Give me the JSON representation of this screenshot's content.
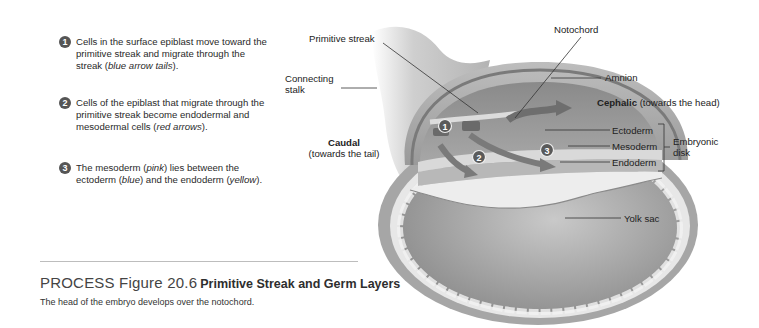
{
  "steps": [
    {
      "number": "1",
      "text_before": "Cells in the surface epiblast move toward the primitive streak and migrate through the streak (",
      "italic": "blue arrow tails",
      "text_after": ")."
    },
    {
      "number": "2",
      "text_before": "Cells of the epiblast that migrate through the primitive streak become endodermal and mesodermal cells (",
      "italic": "red arrows",
      "text_after": ")."
    },
    {
      "number": "3",
      "text_before": "The mesoderm (",
      "italic": "pink",
      "text_mid1": ") lies between the ectoderm (",
      "italic2": "blue",
      "text_mid2": ") and the endoderm (",
      "italic3": "yellow",
      "text_after": ")."
    }
  ],
  "caption": {
    "lead": "PROCESS Figure 20.6",
    "title": "Primitive Streak and Germ Layers",
    "subtitle": "The head of the embryo develops over the notochord."
  },
  "labels": {
    "primitive_streak": "Primitive streak",
    "notochord": "Notochord",
    "connecting_stalk_1": "Connecting",
    "connecting_stalk_2": "stalk",
    "amnion": "Amnion",
    "cephalic_bold": "Cephalic",
    "cephalic_rest": " (towards the head)",
    "caudal_bold": "Caudal",
    "caudal_rest": "(towards the tail)",
    "ectoderm": "Ectoderm",
    "mesoderm": "Mesoderm",
    "endoderm": "Endoderm",
    "embryonic_disk_1": "Embryonic",
    "embryonic_disk_2": "disk",
    "yolk_sac": "Yolk sac"
  },
  "diagram_markers": [
    "1",
    "2",
    "3"
  ]
}
